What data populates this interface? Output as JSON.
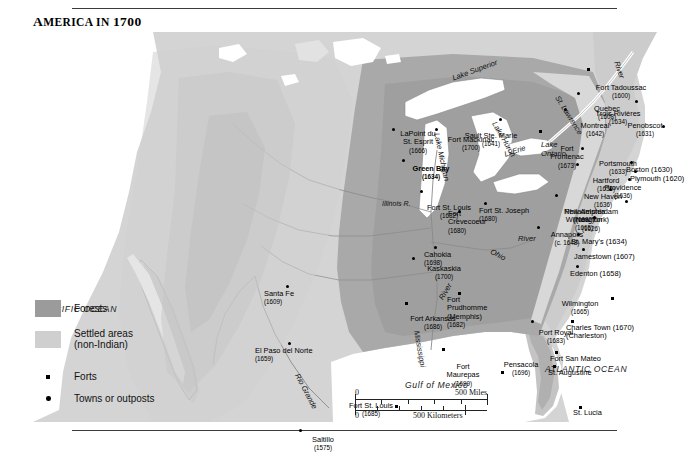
{
  "title": {
    "lead": "A",
    "rest": "MERICA IN ",
    "year": "1700",
    "full": "AMERICA IN 1700"
  },
  "legend": {
    "items": [
      {
        "label": "Forests",
        "kind": "swatch",
        "color": "#9b9b9b"
      },
      {
        "label": "Settled areas\n(non-Indian)",
        "line1": "Settled areas",
        "line2": "(non-Indian)",
        "kind": "swatch",
        "color": "#cfcfcf"
      },
      {
        "label": "Forts",
        "kind": "square"
      },
      {
        "label": "Towns or outposts",
        "kind": "circle"
      }
    ]
  },
  "scale": {
    "miles_zero": "0",
    "miles_label": "500 Miles",
    "km_zero": "0",
    "km_label": "500 Kilometers"
  },
  "oceans": [
    {
      "name": "PACIFIC OCEAN",
      "x": 10,
      "y": 272
    },
    {
      "name": "ATLANTIC OCEAN",
      "x": 512,
      "y": 332
    },
    {
      "name": "Gulf of Mexico",
      "x": 372,
      "y": 348
    }
  ],
  "hydrography": [
    {
      "name": "Lake Superior",
      "x": 418,
      "y": 42,
      "rot": -20,
      "size": "lg"
    },
    {
      "name": "Lake Michigan",
      "x": 408,
      "y": 100,
      "rot": 78,
      "size": "lg"
    },
    {
      "name": "Lake Huron",
      "x": 465,
      "y": 88,
      "rot": 60,
      "size": "lg"
    },
    {
      "name": "Lake\nOntario",
      "x": 508,
      "y": 108,
      "rot": 0,
      "size": "lg"
    },
    {
      "name": "L. Erie",
      "x": 470,
      "y": 118,
      "rot": -18,
      "size": "lg"
    },
    {
      "name": "St. Lawrence",
      "x": 528,
      "y": 62,
      "rot": 58,
      "size": "lg"
    },
    {
      "name": "River",
      "x": 588,
      "y": 28,
      "rot": 72,
      "size": "lg"
    },
    {
      "name": "Illinois R.",
      "x": 349,
      "y": 168,
      "rot": 0,
      "size": "sm"
    },
    {
      "name": "Ohio",
      "x": 460,
      "y": 215,
      "rot": 28,
      "size": "lg"
    },
    {
      "name": "River",
      "x": 485,
      "y": 202,
      "rot": 0,
      "size": "lg"
    },
    {
      "name": "Mississippi",
      "x": 388,
      "y": 298,
      "rot": 80,
      "size": "lg"
    },
    {
      "name": "River",
      "x": 404,
      "y": 265,
      "rot": -60,
      "size": "lg"
    },
    {
      "name": "Rio Grande",
      "x": 268,
      "y": 340,
      "rot": 62,
      "size": "lg"
    }
  ],
  "places": [
    {
      "name": "Fort Tadoussac",
      "year": "(1600)",
      "mx": 556,
      "my": 38,
      "dx": 588,
      "dy": 52,
      "align": "c",
      "marker": "square"
    },
    {
      "name": "Quebec",
      "year": "(1608)",
      "mx": 546,
      "my": 62,
      "dx": 574,
      "dy": 73,
      "align": "c",
      "marker": "circle"
    },
    {
      "name": "Trois Rivières",
      "year": "(1634)",
      "mx": 604,
      "my": 70,
      "dx": 585,
      "dy": 78,
      "align": "c",
      "marker": "circle"
    },
    {
      "name": "Montreal",
      "year": "(1642)",
      "mx": 533,
      "my": 78,
      "dx": 562,
      "dy": 90,
      "align": "c",
      "marker": "circle"
    },
    {
      "name": "Penobscot",
      "year": "(1631)",
      "mx": 631,
      "my": 95,
      "dx": 612,
      "dy": 90,
      "align": "c",
      "marker": "circle"
    },
    {
      "name": "Portsmouth",
      "year": "(1633)",
      "mx": 550,
      "my": 117,
      "dx": 585,
      "dy": 128,
      "align": "c",
      "marker": "circle"
    },
    {
      "name": "Hartford",
      "year": "(1635)",
      "mx": 545,
      "my": 133,
      "dx": 573,
      "dy": 145,
      "align": "c",
      "marker": "circle"
    },
    {
      "name": "Boston (1630)",
      "year": "",
      "mx": 599,
      "my": 131,
      "dx": 593,
      "dy": 134,
      "align": "l",
      "marker": "circle"
    },
    {
      "name": "Plymouth (1620)",
      "year": "",
      "mx": 603,
      "my": 140,
      "dx": 597,
      "dy": 143,
      "align": "l",
      "marker": "circle"
    },
    {
      "name": "Providence",
      "year": "(1636)",
      "mx": 597,
      "my": 148,
      "dx": 590,
      "dy": 152,
      "align": "c",
      "marker": "circle"
    },
    {
      "name": "New Haven",
      "year": "(1636)",
      "mx": 578,
      "my": 158,
      "dx": 570,
      "dy": 161,
      "align": "c",
      "marker": "circle"
    },
    {
      "name": "New Amsterdam",
      "year": "(1626)",
      "mx": 594,
      "my": 170,
      "dx": 558,
      "dy": 176,
      "align": "c",
      "marker": "circle",
      "alt": "(New York)"
    },
    {
      "name": "Philadelphia",
      "year": "(1682)",
      "mx": 524,
      "my": 164,
      "dx": 552,
      "dy": 176,
      "align": "c",
      "marker": "circle"
    },
    {
      "name": "Wilmington",
      "year": "(1665)",
      "mx": 562,
      "my": 186,
      "dx": 551,
      "dy": 184,
      "align": "c",
      "marker": "circle"
    },
    {
      "name": "Annapolis",
      "year": "(c. 1648)",
      "mx": 506,
      "my": 196,
      "dx": 534,
      "dy": 199,
      "align": "c",
      "marker": "circle"
    },
    {
      "name": "St. Mary's (1634)",
      "year": "",
      "mx": 546,
      "my": 203,
      "dx": 538,
      "dy": 206,
      "align": "l",
      "marker": "circle"
    },
    {
      "name": "Jamestown (1607)",
      "year": "",
      "mx": 551,
      "my": 218,
      "dx": 541,
      "dy": 221,
      "align": "l",
      "marker": "circle"
    },
    {
      "name": "Edenton (1658)",
      "year": "",
      "mx": 545,
      "my": 235,
      "dx": 537,
      "dy": 238,
      "align": "l",
      "marker": "circle"
    },
    {
      "name": "Wilmington",
      "year": "(1665)",
      "mx": 580,
      "my": 267,
      "dx": 547,
      "dy": 268,
      "align": "c",
      "marker": "square"
    },
    {
      "name": "Charles Town (1670)",
      "year": "",
      "mx": 540,
      "my": 290,
      "dx": 533,
      "dy": 292,
      "align": "l",
      "marker": "square",
      "alt": "(Charleston)"
    },
    {
      "name": "Port Royal",
      "year": "(1683)",
      "mx": 500,
      "my": 290,
      "dx": 523,
      "dy": 297,
      "align": "c",
      "marker": "circle"
    },
    {
      "name": "Fort San Mateo",
      "year": "",
      "mx": 524,
      "my": 321,
      "dx": 517,
      "dy": 323,
      "align": "l",
      "marker": "square"
    },
    {
      "name": "St. Augustine",
      "year": "",
      "mx": 522,
      "my": 335,
      "dx": 515,
      "dy": 337,
      "align": "l",
      "marker": "square"
    },
    {
      "name": "St. Lucia",
      "year": "",
      "mx": 548,
      "my": 376,
      "dx": 540,
      "dy": 377,
      "align": "l",
      "marker": "square"
    },
    {
      "name": "Pensacola",
      "year": "(1696)",
      "mx": 470,
      "my": 341,
      "dx": 488,
      "dy": 329,
      "align": "c",
      "marker": "square"
    },
    {
      "name": "Fort\nMaurepas",
      "year": "(1699)",
      "mx": 411,
      "my": 318,
      "dx": 430,
      "dy": 331,
      "align": "c",
      "marker": "square",
      "two": [
        "Fort",
        "Maurepas"
      ]
    },
    {
      "name": "Fort\nPrudhomme",
      "year": "(1682)",
      "mx": 427,
      "my": 262,
      "dx": 414,
      "dy": 264,
      "align": "l",
      "marker": "square",
      "three": [
        "Fort",
        "Prudhomme",
        "(Memphis)"
      ]
    },
    {
      "name": "Fort Arkansas",
      "year": "(1686)",
      "mx": 374,
      "my": 272,
      "dx": 400,
      "dy": 283,
      "align": "c",
      "marker": "square"
    },
    {
      "name": "Fort St. Louis",
      "year": "(1685)",
      "mx": 364,
      "my": 375,
      "dx": 338,
      "dy": 370,
      "align": "c",
      "marker": "square"
    },
    {
      "name": "Saltillo",
      "year": "(1575)",
      "mx": 268,
      "my": 399,
      "dx": 290,
      "dy": 404,
      "align": "c",
      "marker": "circle"
    },
    {
      "name": "El Paso del Norte",
      "year": "(1659)",
      "mx": 257,
      "my": 312,
      "dx": 222,
      "dy": 315,
      "align": "l",
      "marker": "circle"
    },
    {
      "name": "Santa Fe",
      "year": "(1609)",
      "mx": 255,
      "my": 255,
      "dx": 231,
      "dy": 258,
      "align": "l",
      "marker": "circle"
    },
    {
      "name": "Kaskaskia",
      "year": "(1700)",
      "mx": 381,
      "my": 227,
      "dx": 411,
      "dy": 233,
      "align": "c",
      "marker": "circle"
    },
    {
      "name": "Cahokia",
      "year": "(1698)",
      "mx": 403,
      "my": 216,
      "dx": 391,
      "dy": 219,
      "align": "l",
      "marker": "circle"
    },
    {
      "name": "Fort\nCrevecoeur",
      "year": "(1680)",
      "mx": 427,
      "my": 180,
      "dx": 415,
      "dy": 178,
      "align": "l",
      "marker": "circle",
      "two": [
        "Fort",
        "Crevecoeur"
      ]
    },
    {
      "name": "Fort St. Louis",
      "year": "(1682)",
      "mx": 389,
      "my": 160,
      "dx": 416,
      "dy": 172,
      "align": "c",
      "marker": "circle"
    },
    {
      "name": "Fort St. Joseph",
      "year": "(1680)",
      "mx": 453,
      "my": 172,
      "dx": 446,
      "dy": 175,
      "align": "l",
      "marker": "circle"
    },
    {
      "name": "Fort\nFrontenac",
      "year": "(1673)",
      "mx": 508,
      "my": 100,
      "dx": 534,
      "dy": 113,
      "align": "c",
      "marker": "square",
      "two": [
        "Fort",
        "Frontenac"
      ]
    },
    {
      "name": "Sault Ste. Marie",
      "year": "(1641)",
      "mx": 468,
      "my": 88,
      "dx": 458,
      "dy": 100,
      "align": "c",
      "marker": "circle"
    },
    {
      "name": "Fort Mackinac",
      "year": "(1700)",
      "mx": 404,
      "my": 98,
      "dx": 438,
      "dy": 104,
      "align": "c",
      "marker": "circle"
    },
    {
      "name": "LaPoint du\nSt. Esprit",
      "year": "(1666)",
      "mx": 361,
      "my": 98,
      "dx": 385,
      "dy": 98,
      "align": "c",
      "marker": "circle",
      "two": [
        "LaPoint du",
        "St. Esprit"
      ]
    },
    {
      "name": "Green Bay",
      "year": "(1634)",
      "mx": 371,
      "my": 129,
      "dx": 398,
      "dy": 133,
      "align": "c",
      "marker": "circle",
      "bold": true
    }
  ]
}
